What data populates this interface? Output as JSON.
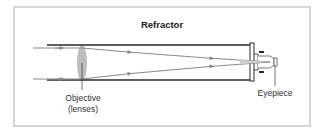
{
  "diagram": {
    "title": "Refractor",
    "labels": {
      "objective_line1": "Objective",
      "objective_line2": "(lenses)",
      "eyepiece": "Eyepiece"
    },
    "colors": {
      "frame_border": "#d6d6d6",
      "tube": "#2a2a2a",
      "ray": "#8a8a8a",
      "lens": "#bdbdbd",
      "text": "#333333"
    }
  }
}
